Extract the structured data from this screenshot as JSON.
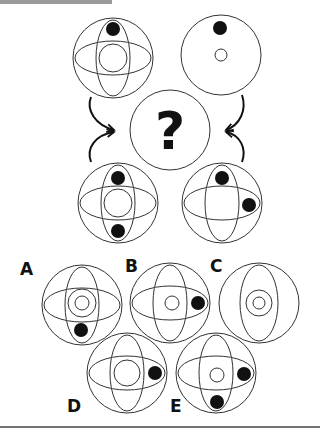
{
  "puzzle": {
    "question_mark": "?",
    "colors": {
      "stroke": "#333333",
      "dot": "#111111",
      "header_bar": "#9a9a9a",
      "rule": "#444444"
    },
    "inputs": [
      {
        "id": "top-left",
        "ellipses": true,
        "inner_circle": "large",
        "dots": [
          "top"
        ]
      },
      {
        "id": "top-right",
        "ellipses": false,
        "inner_circle": "small",
        "dots": [
          "top"
        ]
      },
      {
        "id": "bottom-left",
        "ellipses": true,
        "inner_circle": "large",
        "dots": [
          "top",
          "bottom"
        ]
      },
      {
        "id": "bottom-right",
        "ellipses": true,
        "inner_circle": "none",
        "dots": [
          "top",
          "right"
        ]
      }
    ],
    "options": [
      {
        "label": "A",
        "ellipses": true,
        "inner_circle": "double",
        "dots": [
          "bottom"
        ]
      },
      {
        "label": "B",
        "ellipses": true,
        "inner_circle": "small",
        "dots": [
          "right"
        ]
      },
      {
        "label": "C",
        "ellipses": "vertical-only",
        "inner_circle": "double",
        "dots": []
      },
      {
        "label": "D",
        "ellipses": true,
        "inner_circle": "large",
        "dots": [
          "right"
        ]
      },
      {
        "label": "E",
        "ellipses": true,
        "inner_circle": "small",
        "dots": [
          "right",
          "bottom"
        ]
      }
    ]
  }
}
